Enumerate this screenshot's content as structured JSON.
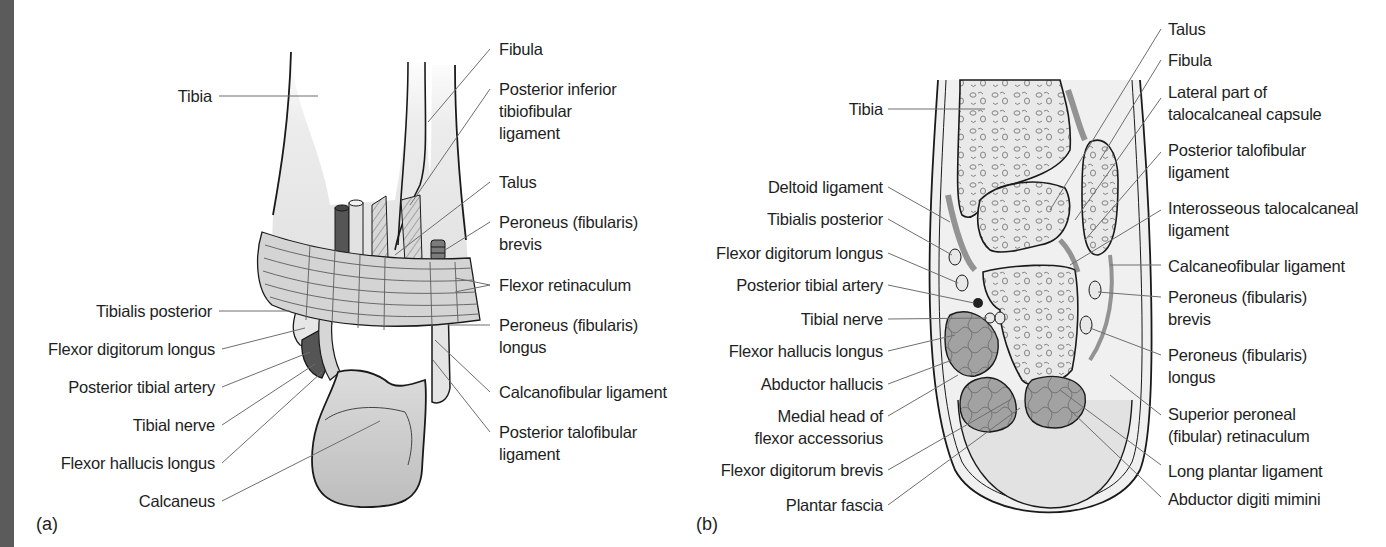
{
  "figure": {
    "panels": [
      {
        "id": "(a)",
        "left_labels": [
          {
            "text": "Tibia"
          },
          {
            "text": "Tibialis posterior"
          },
          {
            "text": "Flexor digitorum longus"
          },
          {
            "text": "Posterior tibial artery"
          },
          {
            "text": "Tibial nerve"
          },
          {
            "text": "Flexor hallucis longus"
          },
          {
            "text": "Calcaneus"
          }
        ],
        "right_labels": [
          {
            "line1": "Fibula",
            "line2": "",
            "line3": ""
          },
          {
            "line1": "Posterior inferior",
            "line2": "tibiofibular",
            "line3": "ligament"
          },
          {
            "line1": "Talus",
            "line2": "",
            "line3": ""
          },
          {
            "line1": "Peroneus (fibularis)",
            "line2": "brevis",
            "line3": ""
          },
          {
            "line1": "Flexor retinaculum",
            "line2": "",
            "line3": ""
          },
          {
            "line1": "Peroneus (fibularis)",
            "line2": "longus",
            "line3": ""
          },
          {
            "line1": "Calcanofibular ligament",
            "line2": "",
            "line3": ""
          },
          {
            "line1": "Posterior talofibular",
            "line2": "ligament",
            "line3": ""
          }
        ]
      },
      {
        "id": "(b)",
        "left_labels": [
          {
            "line1": "Tibia",
            "line2": ""
          },
          {
            "line1": "Deltoid ligament",
            "line2": ""
          },
          {
            "line1": "Tibialis posterior",
            "line2": ""
          },
          {
            "line1": "Flexor digitorum longus",
            "line2": ""
          },
          {
            "line1": "Posterior tibial artery",
            "line2": ""
          },
          {
            "line1": "Tibial nerve",
            "line2": ""
          },
          {
            "line1": "Flexor hallucis longus",
            "line2": ""
          },
          {
            "line1": "Abductor hallucis",
            "line2": ""
          },
          {
            "line1": "Medial head of",
            "line2": "flexor accessorius"
          },
          {
            "line1": "Flexor digitorum brevis",
            "line2": ""
          },
          {
            "line1": "Plantar fascia",
            "line2": ""
          }
        ],
        "right_labels": [
          {
            "line1": "Talus",
            "line2": ""
          },
          {
            "line1": "Fibula",
            "line2": ""
          },
          {
            "line1": "Lateral part of",
            "line2": "talocalcaneal capsule"
          },
          {
            "line1": "Posterior talofibular",
            "line2": "ligament"
          },
          {
            "line1": "Interosseous talocalcaneal",
            "line2": "ligament"
          },
          {
            "line1": "Calcaneofibular ligament",
            "line2": ""
          },
          {
            "line1": "Peroneus (fibularis)",
            "line2": "brevis"
          },
          {
            "line1": "Peroneus (fibularis)",
            "line2": "longus"
          },
          {
            "line1": "Superior peroneal",
            "line2": "(fibular) retinaculum"
          },
          {
            "line1": "Long plantar ligament",
            "line2": ""
          },
          {
            "line1": "Abductor digiti mimini",
            "line2": ""
          }
        ]
      }
    ],
    "colors": {
      "outline": "#1a1a1a",
      "leader": "#6e6e6e",
      "bone_fill": "#e6e6e6",
      "retinaculum_fill": "#d2d2d2",
      "artery_fill": "#555555",
      "muscle_fill": "#9c9c9c",
      "edge_strip": "#5b5b5b"
    }
  }
}
